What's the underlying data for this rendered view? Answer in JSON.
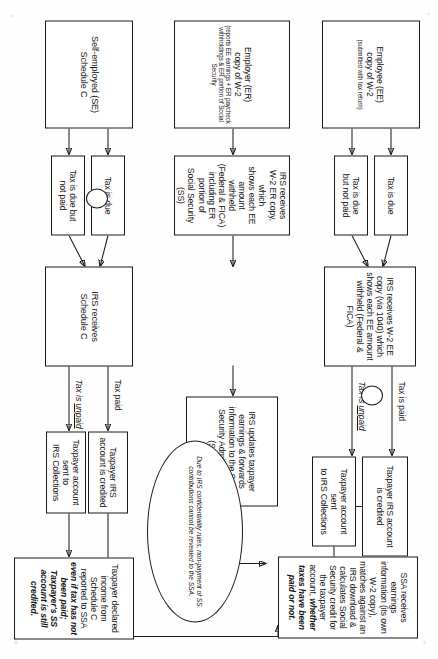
{
  "diagram": {
    "orientation_note": "scanned page rotated 90 degrees",
    "nodes": {
      "employee_source": {
        "main": "Employee (EE)",
        "main2": "copy of W-2",
        "sub": "(submitted with tax return)"
      },
      "employer_source": {
        "main": "Employer (ER)",
        "main2": "copy of W-2",
        "sub": "(reports EE earnings + ER paycheck withholdings & ER portion of Social Security"
      },
      "selfemployed_source": {
        "main": "Self-employed (SE)",
        "main2": "Schedule C"
      },
      "ee_tax_due": "Tax is due",
      "ee_tax_due_not_paid_l1": "Tax is due",
      "ee_tax_due_not_paid_l2": "but not paid",
      "se_tax_due": "Tax is due",
      "se_tax_due_not_paid_l1": "Tax is due but",
      "se_tax_due_not_paid_l2": "not paid",
      "irs_ee_copy": "IRS receives W-2 EE copy (via 1040) which shows each EE amount withheld (Federal & FICA)",
      "irs_er_copy_l1": "IRS receives",
      "irs_er_copy_l2": "W-2 ER copy, which",
      "irs_er_copy_l3": "shows each EE amount",
      "irs_er_copy_l4": "withheld",
      "irs_er_copy_l5": "(Federal & FICA)",
      "irs_er_copy_l6": "including ER portion of",
      "irs_er_copy_l7": "Social Security (SS)",
      "irs_updates": "IRS updates taxpayer earnings & forwards information to the Social Security Administration (SSA)",
      "irs_schedule_c_l1": "IRS receives",
      "irs_schedule_c_l2": "Schedule C",
      "ee_account_credited_l1": "Taxpayer IRS account",
      "ee_account_credited_l2": "is credited",
      "ee_account_collections_l1": "Taxpayer account sent",
      "ee_account_collections_l2": "to IRS Collections",
      "se_account_credited_l1": "Taxpayer IRS",
      "se_account_credited_l2": "account is credited",
      "se_account_collections_l1": "Taxpayer account sent to",
      "se_account_collections_l2": "IRS Collections",
      "ssa_box_plain": "SSA receives earnings information (its own W-2 copy), matches against an IRS download & calculates Social Security credit for the taxpayer account,",
      "ssa_box_emph": "whether taxes have been paid or not.",
      "sched_c_result_plain": "Taxpayer declared income from Schedule C reported to SSA ",
      "sched_c_result_emph": "even if tax has not been paid; Taxpayer's SS account is still credited.",
      "confidentiality_note": "Due to IRS confidentiality rules, non-payment of SS contributions cannot be revealed to the SSA."
    },
    "edge_labels": {
      "ee_tax_is_paid": "Tax is paid",
      "ee_tax_is_unpaid": "Tax is unpaid",
      "se_tax_paid": "Tax paid",
      "se_tax_is_unpaid": "Tax is unpaid",
      "tax_is_prefix": "Tax is "
    },
    "colors": {
      "stroke": "#1a1a1a",
      "text": "#141414",
      "background": "#ffffff"
    }
  }
}
